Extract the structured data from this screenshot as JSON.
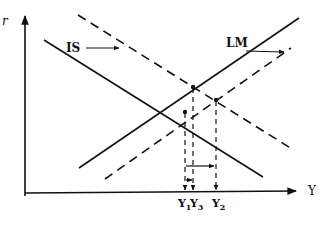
{
  "diagram": {
    "type": "IS-LM shift diagram",
    "axes": {
      "y_label": "r",
      "x_label": "Y"
    },
    "curves": {
      "is_label": "IS",
      "lm_label": "LM"
    },
    "x_ticks": [
      {
        "label": "Y",
        "sub": "1"
      },
      {
        "label": "Y",
        "sub": "3"
      },
      {
        "label": "Y",
        "sub": "2"
      }
    ],
    "colors": {
      "ink": "#111111",
      "background": "#ffffff"
    }
  }
}
